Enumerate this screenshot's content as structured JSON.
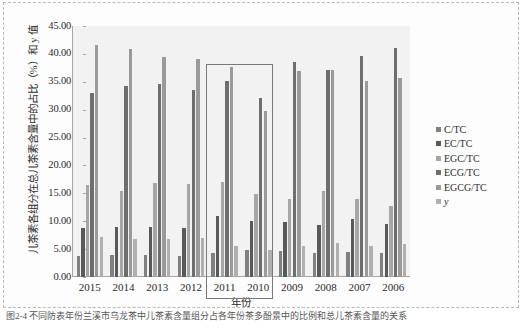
{
  "figure": {
    "caption": "图2-4  不同防表年份兰溪市乌龙茶中儿茶素含量组分占各年份茶多酚景中的比例和总儿茶素含量的关系"
  },
  "chart_data": {
    "type": "bar",
    "title": "",
    "xlabel": "年份",
    "ylabel": "儿茶素各组分在总儿茶素含量中的占比（%）和 y 值",
    "categories": [
      "2015",
      "2014",
      "2013",
      "2012",
      "2011",
      "2010",
      "2009",
      "2008",
      "2007",
      "2006"
    ],
    "ylim": [
      0,
      45
    ],
    "ytick_labels": [
      "0.00",
      "5.00",
      "10.00",
      "15.00",
      "20.00",
      "25.00",
      "30.00",
      "35.00",
      "40.00",
      "45.00"
    ],
    "ytick_values": [
      0,
      5,
      10,
      15,
      20,
      25,
      30,
      35,
      40,
      45
    ],
    "grid": false,
    "legend_position": "right",
    "series": [
      {
        "name": "C/TC",
        "color": "#808080",
        "values": [
          3.85,
          3.95,
          4.0,
          3.8,
          4.25,
          4.8,
          4.65,
          4.3,
          4.45,
          4.25
        ]
      },
      {
        "name": "EC/TC",
        "color": "#595959",
        "values": [
          8.85,
          9.05,
          8.95,
          8.7,
          10.95,
          10.0,
          9.9,
          9.25,
          10.35,
          9.55
        ]
      },
      {
        "name": "EGC/TC",
        "color": "#a6a6a6",
        "values": [
          16.45,
          15.35,
          16.85,
          16.6,
          17.0,
          14.8,
          13.9,
          15.5,
          14.0,
          12.8
        ]
      },
      {
        "name": "ECG/TC",
        "color": "#6e6e6e",
        "values": [
          33.0,
          34.2,
          34.55,
          33.55,
          35.1,
          32.1,
          38.5,
          37.2,
          39.7,
          41.0
        ]
      },
      {
        "name": "EGCG/TC",
        "color": "#9a9a9a",
        "values": [
          41.65,
          40.9,
          39.4,
          39.0,
          37.65,
          29.85,
          36.9,
          37.2,
          35.1,
          35.6
        ]
      },
      {
        "name": "y",
        "color": "#b0b0b0",
        "values": [
          7.15,
          6.85,
          6.8,
          6.95,
          5.6,
          4.9,
          5.65,
          6.15,
          5.6,
          6.0
        ]
      }
    ],
    "highlight": {
      "label": "highlight-rectangle",
      "start_category": "2011",
      "end_category": "2010",
      "top_value": 38.2
    }
  },
  "legend": {
    "items": [
      {
        "label": "C/TC",
        "color": "#808080",
        "italic": false
      },
      {
        "label": "EC/TC",
        "color": "#595959",
        "italic": false
      },
      {
        "label": "EGC/TC",
        "color": "#a6a6a6",
        "italic": false
      },
      {
        "label": "ECG/TC",
        "color": "#6e6e6e",
        "italic": false
      },
      {
        "label": "EGCG/TC",
        "color": "#9a9a9a",
        "italic": false
      },
      {
        "label": "y",
        "color": "#b0b0b0",
        "italic": true
      }
    ]
  }
}
